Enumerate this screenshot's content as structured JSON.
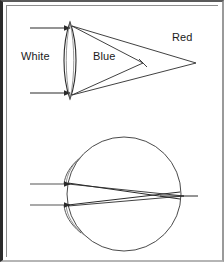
{
  "figure": {
    "background_color": "#ffffff",
    "stroke_color": "#2b2b2b",
    "frame_color": "#2b2b2b",
    "width": 224,
    "height": 262
  },
  "labels": {
    "white": "White",
    "blue": "Blue",
    "red": "Red"
  },
  "panels": {
    "top": {
      "name": "lens-panel",
      "lens": {
        "type": "biconvex-lens",
        "center_x": 70,
        "top_y": 22,
        "bottom_y": 99,
        "half_width": 7
      },
      "incoming_rays": [
        {
          "from_x": 30,
          "to_x": 70,
          "y": 28
        },
        {
          "from_x": 30,
          "to_x": 70,
          "y": 93
        }
      ],
      "blue_focus": {
        "x": 143,
        "y": 63
      },
      "red_focus": {
        "x": 196,
        "y": 63
      }
    },
    "bottom": {
      "name": "eye-panel",
      "eyeball": {
        "type": "circle",
        "center_x": 124,
        "center_y": 194,
        "radius": 57
      },
      "cornea_arcs": [
        {
          "position": "upper-left"
        },
        {
          "position": "lower-left"
        }
      ],
      "incoming_rays": [
        {
          "from_x": 30,
          "to_x": 70,
          "y": 184
        },
        {
          "from_x": 30,
          "to_x": 70,
          "y": 205
        }
      ],
      "focus": {
        "x": 178,
        "y": 196
      },
      "axis_extension_x": 198
    }
  }
}
